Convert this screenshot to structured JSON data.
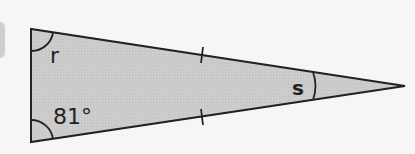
{
  "figure": {
    "shape": "isosceles-triangle",
    "fill_color": "#cccccc",
    "stroke_color": "#222222",
    "background": "#f6f6f6",
    "labels": {
      "top_left_angle": "r",
      "bottom_left_angle": "81°",
      "right_angle": "s"
    },
    "equal_side_marks": 2
  }
}
